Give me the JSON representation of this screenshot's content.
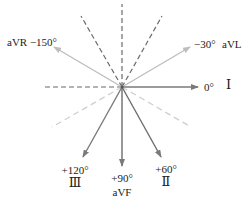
{
  "colors": {
    "dashed_dark": "#6b6b6b",
    "dashed_light": "#cfcfcf",
    "arrow_light": "#bdbdbd",
    "arrow_dark": "#7a7a7a",
    "text": "#222222"
  },
  "leads": [
    {
      "lead": "I",
      "angle": "0°",
      "numeral": "Ⅰ"
    },
    {
      "lead": "II",
      "angle": "+60°",
      "numeral": "Ⅱ"
    },
    {
      "lead": "III",
      "angle": "+120°",
      "numeral": "Ⅲ"
    },
    {
      "lead": "aVR",
      "angle": "−150°",
      "name": "aVR"
    },
    {
      "lead": "aVL",
      "angle": "−30°",
      "name": "aVL"
    },
    {
      "lead": "aVF",
      "angle": "+90°",
      "name": "aVF"
    }
  ],
  "labels": {
    "avr": "aVR −150°",
    "avl_angle": "−30°",
    "avl_name": "aVL",
    "i_angle": "0°",
    "i_numeral": "Ⅰ",
    "iii_angle": "+120°",
    "iii_numeral": "Ⅲ",
    "avf_angle": "+90°",
    "avf_name": "aVF",
    "ii_angle": "+60°",
    "ii_numeral": "Ⅱ"
  }
}
